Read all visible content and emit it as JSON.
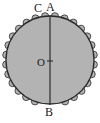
{
  "figure": {
    "type": "geometry-diagram",
    "background_color": "#ffffff",
    "fill_color": "#b3b3b3",
    "stroke_color": "#2b2b2b",
    "label_color": "#1a1a1a",
    "width": 100,
    "height": 123
  },
  "labels": {
    "top_left": "C",
    "top_right": "A",
    "center": "O",
    "bottom": "B"
  },
  "geometry": {
    "circle": {
      "center_x": 50,
      "center_y": 60,
      "radius": 44
    },
    "diameter": {
      "from": "A",
      "to": "B",
      "x": 50,
      "y_top": 16,
      "y_bottom": 104
    },
    "center_tick": {
      "x1": 47,
      "x2": 53,
      "y": 61
    },
    "scallops": {
      "count": 26,
      "bump_radius": 4,
      "arc_start_deg": 20,
      "arc_end_deg": 340
    }
  }
}
